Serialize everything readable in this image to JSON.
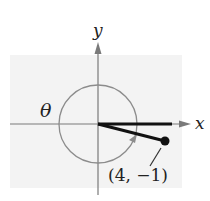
{
  "diagram": {
    "type": "angle-in-standard-position",
    "axes": {
      "x_label": "x",
      "y_label": "y"
    },
    "angle_label": "θ",
    "point": {
      "label": "(4, −1)",
      "x": 4,
      "y": -1
    },
    "colors": {
      "background_panel": "#f3f3f3",
      "axis": "#7a7a7a",
      "circle": "#8c8c8c",
      "terminal_side": "#111111",
      "text": "#222222"
    }
  }
}
